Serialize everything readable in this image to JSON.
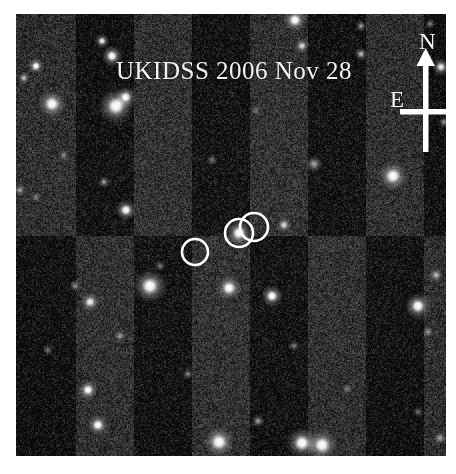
{
  "figure": {
    "caption_text": "UKIDSS 2006 Nov 28",
    "survey_name": "UKIDSS",
    "observation_date": "2006 Nov 28",
    "media_type": "astronomical-survey-image",
    "background_color": "#ffffff",
    "plate_background_color": "#3a3a3a",
    "annotation_color": "#ffffff"
  },
  "plate": {
    "left": 16,
    "top": 14,
    "width": 430,
    "height": 442
  },
  "compass": {
    "north_label": "N",
    "east_label": "E",
    "north_direction": "up",
    "east_direction": "left",
    "color": "#ffffff"
  },
  "annotations": {
    "circles": [
      {
        "id": "circle-left",
        "cx": 179,
        "cy": 238,
        "r": 13,
        "contains_source": false
      },
      {
        "id": "circle-center",
        "cx": 223,
        "cy": 219,
        "r": 14,
        "contains_source": true
      },
      {
        "id": "circle-right",
        "cx": 238,
        "cy": 213,
        "r": 14,
        "contains_source": false
      }
    ]
  },
  "chart_data": {
    "type": "scatter",
    "title": "UKIDSS 2006 Nov 28",
    "xlabel": "",
    "ylabel": "",
    "xlim": [
      0,
      430
    ],
    "ylim": [
      0,
      442
    ],
    "grid": false,
    "legend": "none",
    "stars": [
      {
        "x": 20,
        "y": 52,
        "r": 3.4,
        "b": 1.0
      },
      {
        "x": 86,
        "y": 27,
        "r": 3.0,
        "b": 0.95
      },
      {
        "x": 96,
        "y": 42,
        "r": 4.4,
        "b": 1.0
      },
      {
        "x": 8,
        "y": 64,
        "r": 2.6,
        "b": 0.8
      },
      {
        "x": 36,
        "y": 90,
        "r": 6.0,
        "b": 1.0
      },
      {
        "x": 100,
        "y": 92,
        "r": 7.4,
        "b": 1.0
      },
      {
        "x": 110,
        "y": 83,
        "r": 4.4,
        "b": 0.92
      },
      {
        "x": 279,
        "y": 6,
        "r": 5.0,
        "b": 1.0
      },
      {
        "x": 345,
        "y": 12,
        "r": 2.4,
        "b": 0.7
      },
      {
        "x": 286,
        "y": 32,
        "r": 3.2,
        "b": 0.88
      },
      {
        "x": 345,
        "y": 40,
        "r": 2.8,
        "b": 0.78
      },
      {
        "x": 425,
        "y": 53,
        "r": 3.6,
        "b": 0.95
      },
      {
        "x": 414,
        "y": 10,
        "r": 2.2,
        "b": 0.62
      },
      {
        "x": 428,
        "y": 108,
        "r": 2.4,
        "b": 0.66
      },
      {
        "x": 48,
        "y": 141,
        "r": 2.4,
        "b": 0.62
      },
      {
        "x": 88,
        "y": 168,
        "r": 2.6,
        "b": 0.7
      },
      {
        "x": 4,
        "y": 176,
        "r": 2.6,
        "b": 0.72
      },
      {
        "x": 298,
        "y": 150,
        "r": 3.6,
        "b": 0.72
      },
      {
        "x": 377,
        "y": 162,
        "r": 6.2,
        "b": 1.0
      },
      {
        "x": 110,
        "y": 196,
        "r": 4.4,
        "b": 1.0
      },
      {
        "x": 20,
        "y": 183,
        "r": 2.2,
        "b": 0.6
      },
      {
        "x": 223,
        "y": 219,
        "r": 5.6,
        "b": 1.0
      },
      {
        "x": 268,
        "y": 211,
        "r": 3.2,
        "b": 0.88
      },
      {
        "x": 144,
        "y": 252,
        "r": 2.4,
        "b": 0.6
      },
      {
        "x": 59,
        "y": 272,
        "r": 2.6,
        "b": 0.64
      },
      {
        "x": 134,
        "y": 272,
        "r": 7.0,
        "b": 1.0
      },
      {
        "x": 213,
        "y": 274,
        "r": 5.4,
        "b": 1.0
      },
      {
        "x": 256,
        "y": 282,
        "r": 4.6,
        "b": 1.0
      },
      {
        "x": 74,
        "y": 288,
        "r": 4.0,
        "b": 0.95
      },
      {
        "x": 402,
        "y": 292,
        "r": 5.6,
        "b": 1.0
      },
      {
        "x": 420,
        "y": 261,
        "r": 3.0,
        "b": 0.78
      },
      {
        "x": 104,
        "y": 322,
        "r": 2.6,
        "b": 0.68
      },
      {
        "x": 278,
        "y": 332,
        "r": 2.4,
        "b": 0.6
      },
      {
        "x": 72,
        "y": 376,
        "r": 4.2,
        "b": 1.0
      },
      {
        "x": 172,
        "y": 360,
        "r": 2.4,
        "b": 0.62
      },
      {
        "x": 331,
        "y": 375,
        "r": 2.4,
        "b": 0.58
      },
      {
        "x": 412,
        "y": 318,
        "r": 2.6,
        "b": 0.66
      },
      {
        "x": 82,
        "y": 411,
        "r": 4.4,
        "b": 1.0
      },
      {
        "x": 203,
        "y": 428,
        "r": 6.6,
        "b": 1.0
      },
      {
        "x": 242,
        "y": 407,
        "r": 2.8,
        "b": 0.7
      },
      {
        "x": 286,
        "y": 429,
        "r": 6.4,
        "b": 1.0
      },
      {
        "x": 306,
        "y": 431,
        "r": 6.6,
        "b": 1.0
      },
      {
        "x": 246,
        "y": 544,
        "r": 3.0,
        "b": 0.7
      },
      {
        "x": 424,
        "y": 424,
        "r": 3.0,
        "b": 0.72
      },
      {
        "x": 402,
        "y": 398,
        "r": 2.2,
        "b": 0.58
      },
      {
        "x": 32,
        "y": 336,
        "r": 2.2,
        "b": 0.56
      },
      {
        "x": 196,
        "y": 146,
        "r": 2.4,
        "b": 0.58
      },
      {
        "x": 240,
        "y": 96,
        "r": 2.2,
        "b": 0.52
      }
    ]
  }
}
